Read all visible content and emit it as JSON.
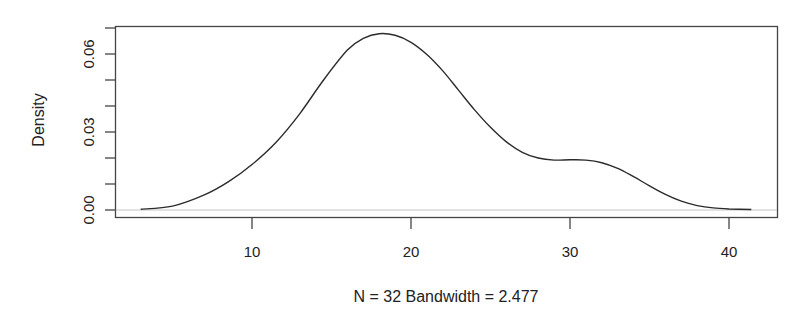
{
  "chart_data": {
    "type": "line",
    "subtype": "kernel-density",
    "title": "",
    "xlabel": "N = 32   Bandwidth = 2.477",
    "ylabel": "Density",
    "xlim": [
      2.97,
      43.0
    ],
    "ylim": [
      0,
      0.0705
    ],
    "x_ticks": [
      10,
      20,
      30,
      40
    ],
    "y_ticks": [
      0.0,
      0.01,
      0.02,
      0.03,
      0.04,
      0.05,
      0.06,
      0.07
    ],
    "y_tick_labels": [
      "0.00",
      "0.03",
      "0.06"
    ],
    "grid": false,
    "legend": null,
    "baseline": 0,
    "series": [
      {
        "name": "density",
        "x": [
          3.0,
          5.0,
          7.0,
          8.5,
          10.0,
          11.5,
          13.0,
          14.5,
          16.0,
          17.0,
          18.0,
          19.0,
          20.0,
          21.0,
          22.0,
          23.0,
          24.0,
          25.0,
          26.0,
          27.0,
          28.0,
          29.0,
          30.0,
          31.0,
          32.0,
          33.0,
          34.0,
          35.0,
          36.0,
          37.0,
          38.0,
          39.0,
          40.0,
          41.4
        ],
        "y": [
          0.0003,
          0.0015,
          0.0058,
          0.0108,
          0.0175,
          0.026,
          0.037,
          0.05,
          0.0615,
          0.066,
          0.0678,
          0.0672,
          0.0645,
          0.0598,
          0.0535,
          0.046,
          0.0385,
          0.0318,
          0.0262,
          0.0222,
          0.02,
          0.0192,
          0.0193,
          0.0192,
          0.0182,
          0.016,
          0.0128,
          0.0093,
          0.006,
          0.0034,
          0.0017,
          0.0008,
          0.0004,
          0.0002
        ]
      }
    ]
  },
  "colors": {
    "curve": "#2b2b2b",
    "axis": "#444444",
    "baseline": "#bfbfbf",
    "background": "#ffffff"
  }
}
